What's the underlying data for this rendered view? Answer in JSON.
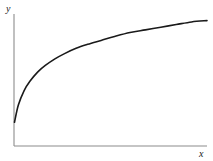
{
  "figure": {
    "background_color": "#ffffff",
    "axis_color": "#8c8c8c",
    "curve_color": "#1a1a1a"
  },
  "labels": {
    "x_axis": "x",
    "y_axis": "y"
  },
  "chart_data": {
    "type": "line",
    "title": "",
    "subtitle": "",
    "xlabel": "x",
    "ylabel": "y",
    "grid": false,
    "legend": null,
    "annotations": [],
    "xticks": [],
    "yticks": [],
    "xlim": [
      0,
      100
    ],
    "ylim": [
      0,
      100
    ],
    "series": [
      {
        "name": "concave increasing curve",
        "shape": "logarithmic",
        "color": "#1a1a1a",
        "line_width": 1.6,
        "x": [
          0,
          2,
          5,
          8,
          12,
          16,
          21,
          26,
          32,
          38,
          45,
          52,
          60,
          68,
          76,
          84,
          92,
          100
        ],
        "y": [
          18,
          31,
          42,
          49,
          56,
          61,
          66,
          70,
          74,
          77,
          80,
          83,
          86,
          88,
          90,
          92,
          94,
          95
        ]
      }
    ]
  }
}
